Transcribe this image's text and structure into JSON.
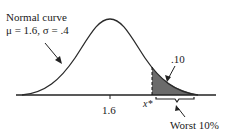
{
  "diagram": {
    "curve_label_line1": "Normal curve",
    "curve_label_line2": "μ = 1.6, σ = .4",
    "mean_tick_label": "1.6",
    "cutoff_label": "x*",
    "area_label": ".10",
    "brace_label": "Worst 10%",
    "colors": {
      "curve": "#2a2a2a",
      "shaded": "#6b6b6b",
      "axis": "#222222"
    }
  }
}
